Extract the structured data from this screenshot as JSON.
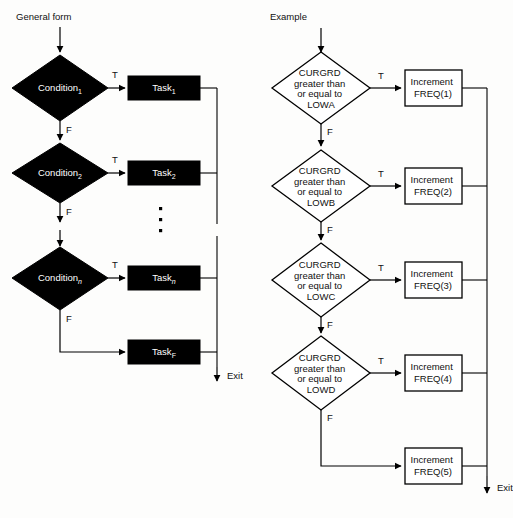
{
  "figure": {
    "panels": [
      {
        "id": "general-form",
        "title": "General form",
        "style": "solid-black-shapes",
        "decisions": [
          {
            "label_base": "Condition",
            "subscript": "1",
            "true_label": "T",
            "false_label": "F"
          },
          {
            "label_base": "Condition",
            "subscript": "2",
            "true_label": "T",
            "false_label": "F"
          },
          {
            "label_base": "Condition",
            "subscript": "n",
            "true_label": "T",
            "false_label": "F"
          }
        ],
        "tasks": [
          {
            "label_base": "Task",
            "subscript": "1"
          },
          {
            "label_base": "Task",
            "subscript": "2"
          },
          {
            "label_base": "Task",
            "subscript": "n"
          },
          {
            "label_base": "Task",
            "subscript": "F"
          }
        ],
        "ellipsis": "vertical-three-dots",
        "exit_label": "Exit"
      },
      {
        "id": "example",
        "title": "Example",
        "style": "white-outlined-shapes",
        "decisions": [
          {
            "lines": [
              "CURGRD",
              "greater than",
              "or equal to",
              "LOWA"
            ],
            "true_label": "T",
            "false_label": "F"
          },
          {
            "lines": [
              "CURGRD",
              "greater than",
              "or equal to",
              "LOWB"
            ],
            "true_label": "T",
            "false_label": "F"
          },
          {
            "lines": [
              "CURGRD",
              "greater than",
              "or equal to",
              "LOWC"
            ],
            "true_label": "T",
            "false_label": "F"
          },
          {
            "lines": [
              "CURGRD",
              "greater than",
              "or equal to",
              "LOWD"
            ],
            "true_label": "T",
            "false_label": "F"
          }
        ],
        "tasks": [
          {
            "lines": [
              "Increment",
              "FREQ(1)"
            ]
          },
          {
            "lines": [
              "Increment",
              "FREQ(2)"
            ]
          },
          {
            "lines": [
              "Increment",
              "FREQ(3)"
            ]
          },
          {
            "lines": [
              "Increment",
              "FREQ(4)"
            ]
          },
          {
            "lines": [
              "Increment",
              "FREQ(5)"
            ]
          }
        ],
        "exit_label": "Exit"
      }
    ],
    "colors": {
      "ink": "#000000",
      "paper": "#fdfdfc",
      "text_on_dark": "#ffffff",
      "text_on_light": "#111111"
    }
  }
}
